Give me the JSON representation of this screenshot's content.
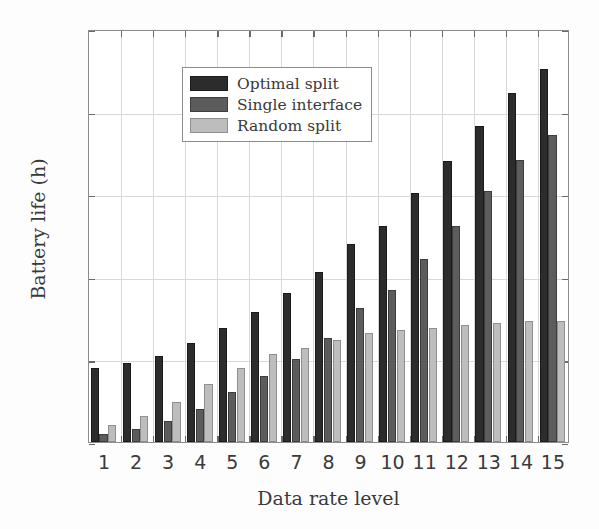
{
  "chart_data": {
    "type": "bar",
    "title": "",
    "xlabel": "Data rate level",
    "ylabel": "Battery life (h)",
    "categories": [
      "1",
      "2",
      "3",
      "4",
      "5",
      "6",
      "7",
      "8",
      "9",
      "10",
      "11",
      "12",
      "13",
      "14",
      "15"
    ],
    "ylim": [
      0,
      25
    ],
    "yticks": [
      0,
      5,
      10,
      15,
      20,
      25
    ],
    "ytick_labels": [
      "0",
      "5",
      "10",
      "15",
      "20",
      "25"
    ],
    "grid": true,
    "legend_position": "upper left",
    "series": [
      {
        "name": "Optimal split",
        "color": "#2c2c2c",
        "values": [
          4.5,
          4.8,
          5.2,
          6.0,
          6.9,
          7.9,
          9.0,
          10.3,
          12.0,
          13.1,
          15.1,
          17.0,
          19.1,
          21.1,
          22.6
        ]
      },
      {
        "name": "Single interface",
        "color": "#5c5c5c",
        "values": [
          0.5,
          0.8,
          1.3,
          2.0,
          3.0,
          4.0,
          5.0,
          6.3,
          8.1,
          9.2,
          11.1,
          13.1,
          15.2,
          17.1,
          18.6
        ]
      },
      {
        "name": "Random split",
        "color": "#bdbdbd",
        "values": [
          1.0,
          1.6,
          2.4,
          3.5,
          4.5,
          5.3,
          5.7,
          6.2,
          6.6,
          6.8,
          6.9,
          7.1,
          7.2,
          7.3,
          7.3
        ]
      }
    ]
  }
}
